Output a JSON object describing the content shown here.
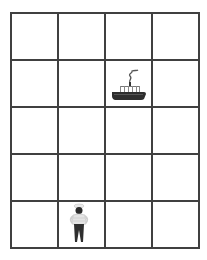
{
  "board": {
    "cols": 4,
    "rows": 5,
    "line_color": "#404040",
    "pieces": [
      {
        "name": "steamship",
        "icon": "steamship-icon",
        "row": 1,
        "col": 2
      },
      {
        "name": "sailor",
        "icon": "sailor-icon",
        "row": 4,
        "col": 1
      }
    ]
  }
}
